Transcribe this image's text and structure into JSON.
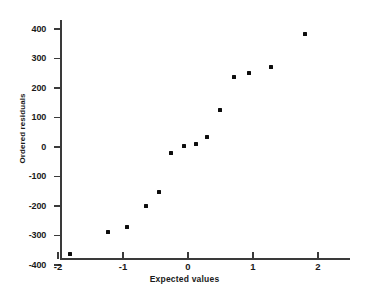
{
  "chart_data": {
    "type": "scatter",
    "title": "",
    "xlabel": "Expected values",
    "ylabel": "Ordered residuals",
    "xlim": [
      -2.15,
      2.45
    ],
    "ylim": [
      -400,
      420
    ],
    "grid": false,
    "legend": null,
    "xticks": [
      -2,
      -1,
      0,
      1,
      2
    ],
    "xtick_labels": [
      "-2",
      "-1",
      "0",
      "1",
      "2"
    ],
    "yticks": [
      400,
      300,
      200,
      100,
      0,
      -100,
      -200,
      -300,
      -400
    ],
    "ytick_labels": [
      "400",
      "300",
      "200",
      "100",
      "0",
      "-100",
      "-200",
      "-300",
      "-400"
    ],
    "points": [
      {
        "x": -1.82,
        "y": -362
      },
      {
        "x": -1.23,
        "y": -288
      },
      {
        "x": -0.94,
        "y": -270
      },
      {
        "x": -0.65,
        "y": -199
      },
      {
        "x": -0.45,
        "y": -152
      },
      {
        "x": -0.26,
        "y": -22
      },
      {
        "x": -0.06,
        "y": 5
      },
      {
        "x": 0.12,
        "y": 10
      },
      {
        "x": 0.29,
        "y": 33
      },
      {
        "x": 0.49,
        "y": 124
      },
      {
        "x": 0.71,
        "y": 236
      },
      {
        "x": 0.94,
        "y": 251
      },
      {
        "x": 1.28,
        "y": 271
      },
      {
        "x": 1.8,
        "y": 384
      }
    ],
    "marker": "square",
    "marker_color": "#0d0d0d",
    "axis_color": "#3a3a3a"
  }
}
